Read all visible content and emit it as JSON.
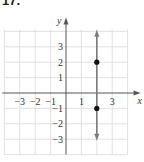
{
  "problem": {
    "number": "17."
  },
  "chart_data": {
    "type": "line",
    "title": "",
    "xlabel": "x",
    "ylabel": "y",
    "xlim": [
      -4,
      4
    ],
    "ylim": [
      -4,
      4
    ],
    "grid": true,
    "x_ticks": [
      {
        "value": -3,
        "label": "−3"
      },
      {
        "value": -2,
        "label": "−2"
      },
      {
        "value": -1,
        "label": "−1"
      },
      {
        "value": 1,
        "label": "1"
      },
      {
        "value": 3,
        "label": "3"
      }
    ],
    "y_ticks": [
      {
        "value": 3,
        "label": "3"
      },
      {
        "value": 2,
        "label": "2"
      },
      {
        "value": 1,
        "label": "1"
      },
      {
        "value": -1,
        "label": "−1"
      },
      {
        "value": -2,
        "label": "−2"
      },
      {
        "value": -3,
        "label": "−3"
      }
    ],
    "series": [
      {
        "name": "vertical line x = 2",
        "kind": "vertical-line",
        "x": 2,
        "y_range": [
          -3.1,
          4.1
        ],
        "arrows": "both",
        "color": "#7a7a7a"
      }
    ],
    "points": [
      {
        "x": 2,
        "y": 2,
        "color": "#111111"
      },
      {
        "x": 2,
        "y": -1,
        "color": "#111111"
      }
    ],
    "colors": {
      "grid": "#d9d9d9",
      "axis": "#555555"
    }
  }
}
